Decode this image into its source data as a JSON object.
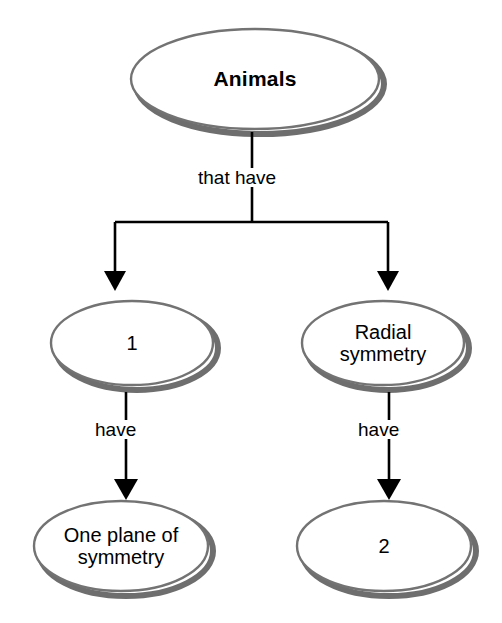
{
  "diagram": {
    "type": "concept-map",
    "background_color": "#ffffff",
    "ellipse_stroke_color": "#737373",
    "ellipse_shadow_color": "#6e6e6e",
    "connector_color": "#000000",
    "text_color": "#000000",
    "nodes": {
      "root": {
        "label": "Animals",
        "style": "bold"
      },
      "left_middle": {
        "label": "1",
        "style": "blank"
      },
      "right_middle": {
        "label": "Radial\nsymmetry",
        "style": "normal"
      },
      "left_bottom": {
        "label": "One plane of\nsymmetry",
        "style": "normal"
      },
      "right_bottom": {
        "label": "2",
        "style": "blank"
      }
    },
    "edges": {
      "root_split": "that have",
      "left_have": "have",
      "right_have": "have"
    }
  }
}
